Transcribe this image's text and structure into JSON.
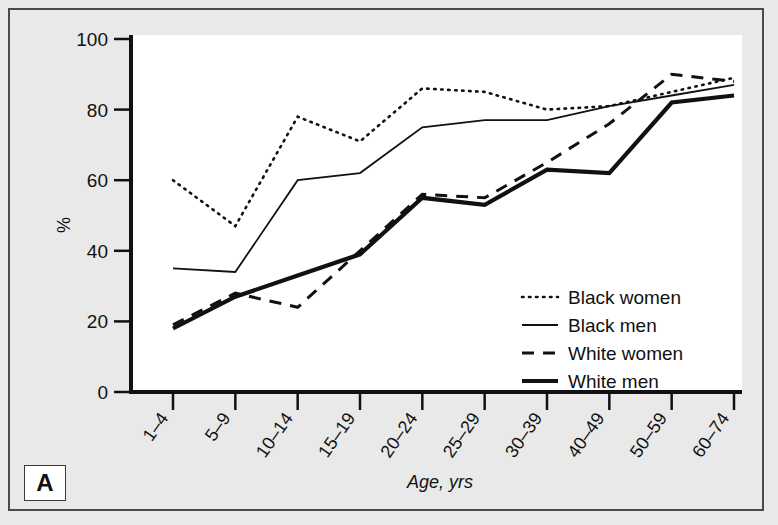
{
  "figure": {
    "panel_label": "A",
    "background_color": "#e9e9e9",
    "plot_background_color": "#ffffff",
    "border_color": "#4a4a4a"
  },
  "chart_data": {
    "type": "line",
    "title": "",
    "xlabel": "Age, yrs",
    "ylabel": "%",
    "ylim": [
      0,
      100
    ],
    "yticks": [
      0,
      20,
      40,
      60,
      80,
      100
    ],
    "grid": false,
    "legend_position": "lower-right-inside",
    "categories": [
      "1–4",
      "5–9",
      "10–14",
      "15–19",
      "20–24",
      "25–29",
      "30–39",
      "40–49",
      "50–59",
      "60–74"
    ],
    "series": [
      {
        "name": "Black women",
        "style": "dotted",
        "color": "#111111",
        "values": [
          60,
          47,
          78,
          71,
          86,
          85,
          80,
          81,
          85,
          89
        ]
      },
      {
        "name": "Black men",
        "style": "thin-solid",
        "color": "#111111",
        "values": [
          35,
          34,
          60,
          62,
          75,
          77,
          77,
          81,
          84,
          87
        ]
      },
      {
        "name": "White women",
        "style": "dashed",
        "color": "#111111",
        "values": [
          19,
          28,
          24,
          40,
          56,
          55,
          65,
          76,
          90,
          88
        ]
      },
      {
        "name": "White men",
        "style": "thick-solid",
        "color": "#111111",
        "values": [
          18,
          27,
          33,
          39,
          55,
          53,
          63,
          62,
          82,
          84
        ]
      }
    ]
  }
}
